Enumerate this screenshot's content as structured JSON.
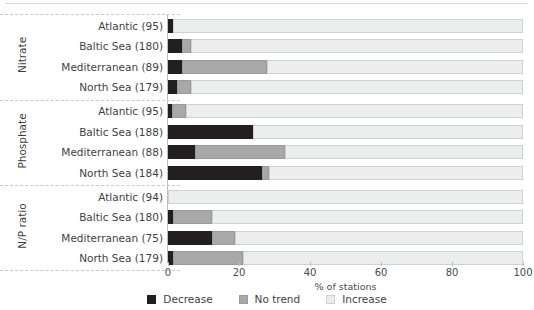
{
  "chart_data": {
    "type": "bar",
    "orientation": "horizontal",
    "stacked": true,
    "stacked_percent": true,
    "title": "",
    "subtitle": "",
    "xlabel": "% of stations",
    "ylabel": "",
    "xlim": [
      0,
      100
    ],
    "xticks": [
      0,
      20,
      40,
      60,
      80,
      100
    ],
    "xticklabels": [
      "0",
      "20",
      "40",
      "60",
      "80",
      "100"
    ],
    "grid": false,
    "legend_position": "bottom-center",
    "legend": [
      "Decrease",
      "No trend",
      "Increase"
    ],
    "series": [
      {
        "name": "Decrease",
        "color": "#231f20",
        "values": [
          1.5,
          4.0,
          4.0,
          2.5,
          1.0,
          24.0,
          7.5,
          26.5,
          0.0,
          1.5,
          12.5,
          1.5
        ]
      },
      {
        "name": "No trend",
        "color": "#a8a8a8",
        "values": [
          0.0,
          2.5,
          24.0,
          4.0,
          4.0,
          0.0,
          25.5,
          2.0,
          0.0,
          11.0,
          6.5,
          19.5
        ]
      },
      {
        "name": "Increase",
        "color": "#eceded",
        "values": [
          98.5,
          93.5,
          72.0,
          93.5,
          95.0,
          76.0,
          67.0,
          71.5,
          100.0,
          87.5,
          81.0,
          79.0
        ]
      }
    ],
    "categories": [
      "Atlantic (95)",
      "Baltic Sea (180)",
      "Mediterranean (89)",
      "North Sea (179)",
      "Atlantic (95)",
      "Baltic Sea (188)",
      "Mediterranean (88)",
      "North Sea (184)",
      "Atlantic (94)",
      "Baltic Sea (180)",
      "Mediterranean (75)",
      "North Sea (179)"
    ],
    "groups": [
      {
        "label": "Nitrate",
        "rows": [
          {
            "label": "Atlantic (95)",
            "decrease": 1.5,
            "no_trend": 0.0,
            "increase": 98.5
          },
          {
            "label": "Baltic Sea (180)",
            "decrease": 4.0,
            "no_trend": 2.5,
            "increase": 93.5
          },
          {
            "label": "Mediterranean (89)",
            "decrease": 4.0,
            "no_trend": 24.0,
            "increase": 72.0
          },
          {
            "label": "North Sea (179)",
            "decrease": 2.5,
            "no_trend": 4.0,
            "increase": 93.5
          }
        ]
      },
      {
        "label": "Phosphate",
        "rows": [
          {
            "label": "Atlantic (95)",
            "decrease": 1.0,
            "no_trend": 4.0,
            "increase": 95.0
          },
          {
            "label": "Baltic Sea (188)",
            "decrease": 24.0,
            "no_trend": 0.0,
            "increase": 76.0
          },
          {
            "label": "Mediterranean (88)",
            "decrease": 7.5,
            "no_trend": 25.5,
            "increase": 67.0
          },
          {
            "label": "North Sea (184)",
            "decrease": 26.5,
            "no_trend": 2.0,
            "increase": 71.5
          }
        ]
      },
      {
        "label": "N/P ratio",
        "rows": [
          {
            "label": "Atlantic (94)",
            "decrease": 0.0,
            "no_trend": 0.0,
            "increase": 100.0
          },
          {
            "label": "Baltic Sea (180)",
            "decrease": 1.5,
            "no_trend": 11.0,
            "increase": 87.5
          },
          {
            "label": "Mediterranean (75)",
            "decrease": 12.5,
            "no_trend": 6.5,
            "increase": 81.0
          },
          {
            "label": "North Sea (179)",
            "decrease": 1.5,
            "no_trend": 19.5,
            "increase": 79.0
          }
        ]
      }
    ]
  },
  "colors": {
    "decrease": "#231f20",
    "no_trend": "#a8a8a8",
    "increase": "#eceded",
    "axis": "#bdbdbd",
    "separator": "#c9c9c9",
    "text": "#3f3f3f",
    "background": "#ffffff"
  },
  "axis": {
    "xlabel": "% of stations",
    "ticks": [
      "0",
      "20",
      "40",
      "60",
      "80",
      "100"
    ]
  },
  "legend": {
    "items": [
      {
        "label": "Decrease",
        "swatch": "decrease-swatch"
      },
      {
        "label": "No trend",
        "swatch": "no-trend-swatch"
      },
      {
        "label": "Increase",
        "swatch": "increase-swatch"
      }
    ]
  }
}
